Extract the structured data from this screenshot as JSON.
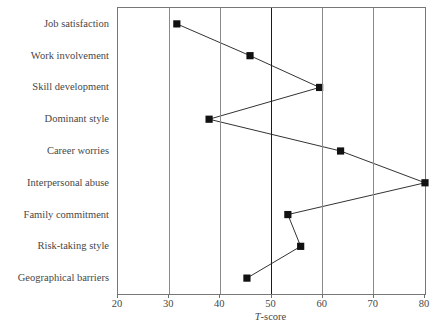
{
  "chart_data": {
    "type": "line",
    "title": "",
    "subtitle": "",
    "xlabel": "T-score",
    "ylabel": "",
    "orientation": "horizontal",
    "grid": true,
    "legend": "none",
    "xlim": [
      20,
      80
    ],
    "xticks": [
      20,
      30,
      40,
      50,
      60,
      70,
      80
    ],
    "xtick_labels": [
      "20",
      "30",
      "40",
      "50",
      "60",
      "70",
      "80"
    ],
    "reference_line": 50,
    "marker": "filled-square",
    "marker_color": "#111111",
    "line_color": "#333333",
    "categories": [
      "Job satisfaction",
      "Work involvement",
      "Skill development",
      "Dominant style",
      "Career worries",
      "Interpersonal abuse",
      "Family commitment",
      "Risk-taking style",
      "Geographical barriers"
    ],
    "values": [
      31.5,
      45.8,
      59.4,
      37.8,
      63.5,
      80.0,
      53.2,
      55.7,
      45.2
    ],
    "series": [
      {
        "name": "T-score profile",
        "points": [
          {
            "category": "Job satisfaction",
            "value": 31.5
          },
          {
            "category": "Work involvement",
            "value": 45.8
          },
          {
            "category": "Skill development",
            "value": 59.4
          },
          {
            "category": "Dominant style",
            "value": 37.8
          },
          {
            "category": "Career worries",
            "value": 63.5
          },
          {
            "category": "Interpersonal abuse",
            "value": 80.0
          },
          {
            "category": "Family commitment",
            "value": 53.2
          },
          {
            "category": "Risk-taking style",
            "value": 55.7
          },
          {
            "category": "Geographical barriers",
            "value": 45.2
          }
        ]
      }
    ]
  },
  "axis": {
    "x_title_italic_part": "T",
    "x_title_rest": "-score"
  }
}
